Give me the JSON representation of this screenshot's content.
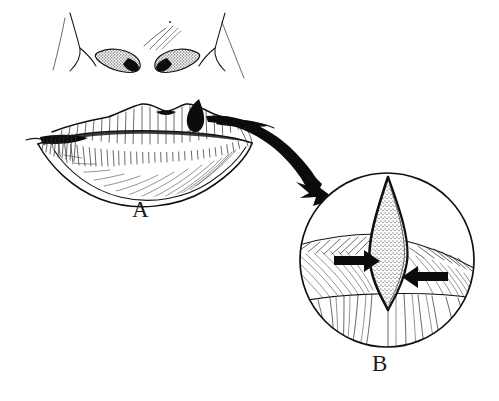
{
  "figure": {
    "background_color": "#ffffff",
    "ink_color": "#111111",
    "width": 499,
    "height": 401
  },
  "panels": [
    {
      "id": "A",
      "label": "A",
      "name": "panel-a-face",
      "caption_position": {
        "x": 132,
        "y": 198
      },
      "description": "Frontal view of nose and mouth with a dark pigmented lesion on the right upper lip vermilion",
      "parts": [
        {
          "name": "nose",
          "description": "nasal tip with alar creases and two stippled nostrils"
        },
        {
          "name": "upper-lip",
          "description": "upper lip with cupid's bow and vertical vermilion striations"
        },
        {
          "name": "lower-lip",
          "description": "lower lip with shading hatch"
        },
        {
          "name": "oral-commissure-left",
          "description": "left mouth corner with dense cross hatching"
        },
        {
          "name": "oral-commissure-right",
          "description": "right mouth corner"
        },
        {
          "name": "lesion",
          "description": "black teardrop shaped pigmented lesion on upper lip"
        }
      ]
    },
    {
      "id": "B",
      "label": "B",
      "name": "panel-b-inset",
      "caption_position": {
        "x": 372,
        "y": 352
      },
      "circle": {
        "cx": 387,
        "cy": 260,
        "r": 88
      },
      "description": "Magnified circular inset showing a full thickness V wedge defect after excision with opposing arrows indicating wound edge approximation",
      "parts": [
        {
          "name": "wedge-defect",
          "description": "stippled lens shaped full thickness wedge excision defect"
        },
        {
          "name": "approximation-arrow-left",
          "description": "solid black arrow pointing right toward the defect"
        },
        {
          "name": "approximation-arrow-right",
          "description": "solid black arrow pointing left toward the defect"
        },
        {
          "name": "vermilion-band",
          "description": "hatched vermilion surface of the lip"
        },
        {
          "name": "mouth-line",
          "description": "dark horizontal line of the oral fissure"
        },
        {
          "name": "lower-lip-surface",
          "description": "lower lip with vertical curving hatch lines"
        }
      ]
    }
  ],
  "connector": {
    "name": "magnification-arrow",
    "type": "curved-arrow",
    "from_panel": "A",
    "to_panel": "B",
    "description": "Thick curved black arrow sweeping from the lip lesion down and to the right into the magnified circle",
    "color": "#0c0c0c"
  }
}
